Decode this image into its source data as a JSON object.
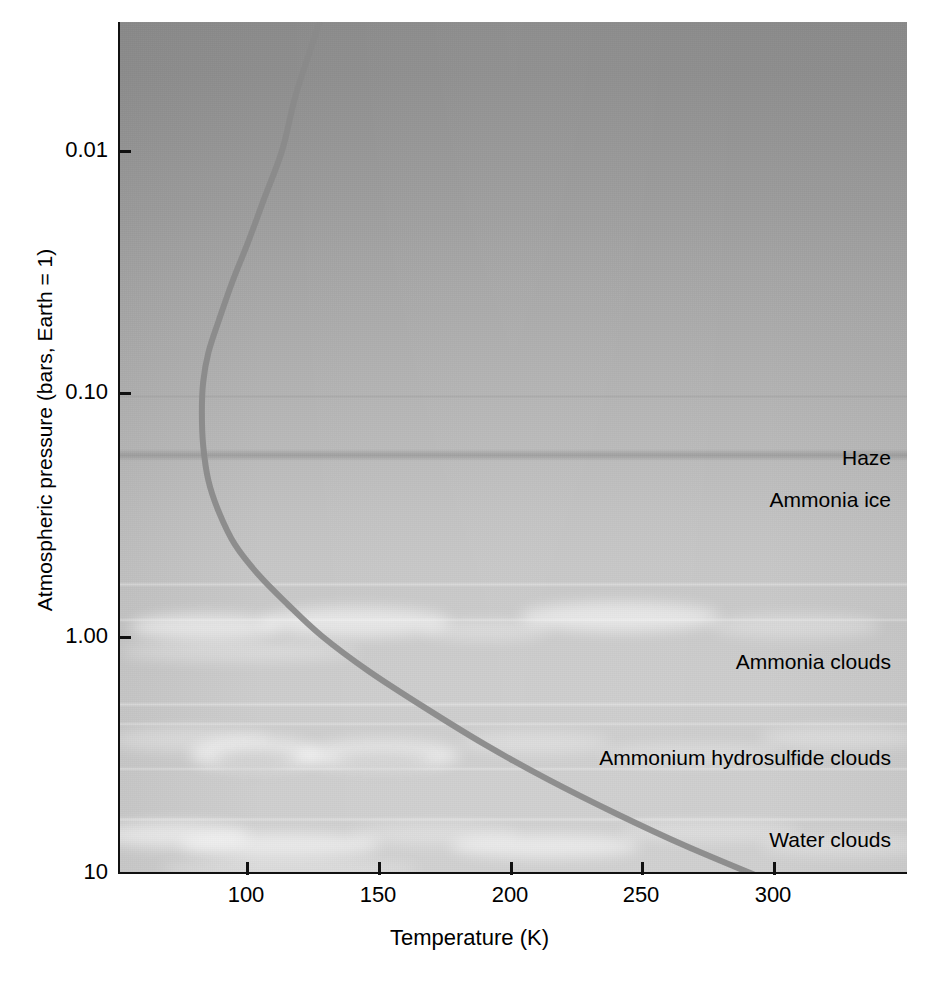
{
  "figure": {
    "background_color": "#ffffff",
    "plot_background_top_color": "#8b8b8b",
    "plot_background_bottom_color": "#d0d0d0",
    "curve_color": "#8a8a8a",
    "axis_color": "#111111"
  },
  "chart_data": {
    "type": "line",
    "title": "",
    "xlabel": "Temperature (K)",
    "ylabel": "Atmospheric pressure (bars, Earth = 1)",
    "xlim": [
      51,
      349
    ],
    "ylim_pressure_bars": [
      0.0022,
      10
    ],
    "yscale": "log",
    "y_axis_inverted": true,
    "grid": false,
    "legend": "none",
    "xticks": [
      100,
      150,
      200,
      250,
      300
    ],
    "xtick_labels": [
      "100",
      "150",
      "200",
      "250",
      "300"
    ],
    "yticks": [
      0.01,
      0.1,
      1.0,
      10
    ],
    "ytick_labels": [
      "0.01",
      "0.10",
      "1.00",
      "10"
    ],
    "series": [
      {
        "name": "Temperature profile",
        "color": "#8a8a8a",
        "linewidth_px": 6,
        "points": [
          {
            "temperature_K": 131,
            "pressure_bars": 0.0022
          },
          {
            "temperature_K": 125,
            "pressure_bars": 0.0035
          },
          {
            "temperature_K": 118,
            "pressure_bars": 0.006
          },
          {
            "temperature_K": 113,
            "pressure_bars": 0.01
          },
          {
            "temperature_K": 106,
            "pressure_bars": 0.016
          },
          {
            "temperature_K": 100,
            "pressure_bars": 0.024
          },
          {
            "temperature_K": 94,
            "pressure_bars": 0.035
          },
          {
            "temperature_K": 89,
            "pressure_bars": 0.05
          },
          {
            "temperature_K": 85,
            "pressure_bars": 0.068
          },
          {
            "temperature_K": 83,
            "pressure_bars": 0.09
          },
          {
            "temperature_K": 82.5,
            "pressure_bars": 0.12
          },
          {
            "temperature_K": 83,
            "pressure_bars": 0.165
          },
          {
            "temperature_K": 85,
            "pressure_bars": 0.23
          },
          {
            "temperature_K": 89,
            "pressure_bars": 0.31
          },
          {
            "temperature_K": 95,
            "pressure_bars": 0.42
          },
          {
            "temperature_K": 104,
            "pressure_bars": 0.56
          },
          {
            "temperature_K": 115,
            "pressure_bars": 0.74
          },
          {
            "temperature_K": 128,
            "pressure_bars": 1.0
          },
          {
            "temperature_K": 146,
            "pressure_bars": 1.4
          },
          {
            "temperature_K": 168,
            "pressure_bars": 2.0
          },
          {
            "temperature_K": 190,
            "pressure_bars": 2.8
          },
          {
            "temperature_K": 214,
            "pressure_bars": 3.9
          },
          {
            "temperature_K": 240,
            "pressure_bars": 5.4
          },
          {
            "temperature_K": 266,
            "pressure_bars": 7.3
          },
          {
            "temperature_K": 296,
            "pressure_bars": 10.0
          }
        ]
      }
    ],
    "annotations": [
      {
        "label": "Haze",
        "pressure_bars": 0.175
      },
      {
        "label": "Ammonia ice",
        "pressure_bars": 0.26
      },
      {
        "label": "Ammonia clouds",
        "pressure_bars": 1.25
      },
      {
        "label": "Ammonium hydrosulfide clouds",
        "pressure_bars": 3.3
      },
      {
        "label": "Water clouds",
        "pressure_bars": 7.4
      }
    ]
  },
  "axes": {
    "y_title": "Atmospheric pressure (bars, Earth = 1)",
    "x_title": "Temperature (K)",
    "y_ticks": [
      {
        "label": "0.01",
        "top_px": 151
      },
      {
        "label": "0.10",
        "top_px": 393
      },
      {
        "label": "1.00",
        "top_px": 637
      },
      {
        "label": "10",
        "top_px": 872
      }
    ],
    "x_ticks": [
      {
        "label": "100",
        "left_px": 246
      },
      {
        "label": "150",
        "left_px": 378
      },
      {
        "label": "200",
        "left_px": 510
      },
      {
        "label": "250",
        "left_px": 641
      },
      {
        "label": "300",
        "left_px": 773
      }
    ]
  },
  "layers": [
    {
      "name": "haze",
      "label": "Haze",
      "top_px": 458
    },
    {
      "name": "ammonia-ice",
      "label": "Ammonia ice",
      "top_px": 500
    },
    {
      "name": "ammonia-clouds",
      "label": "Ammonia clouds",
      "top_px": 662
    },
    {
      "name": "ammonium-hydrosulfide-clouds",
      "label": "Ammonium hydrosulfide clouds",
      "top_px": 758
    },
    {
      "name": "water-clouds",
      "label": "Water clouds",
      "top_px": 840
    }
  ]
}
